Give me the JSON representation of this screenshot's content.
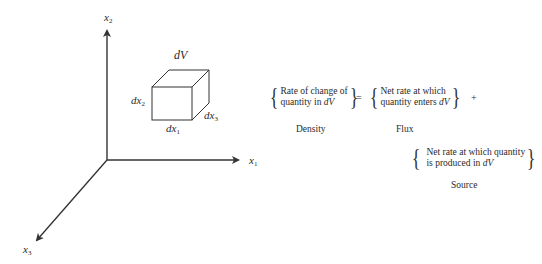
{
  "axes": {
    "x1": {
      "label": "x",
      "sub": "1"
    },
    "x2": {
      "label": "x",
      "sub": "2"
    },
    "x3": {
      "label": "x",
      "sub": "3"
    }
  },
  "cube": {
    "volume_label": "dV",
    "edges": [
      {
        "label": "dx",
        "sub": "1"
      },
      {
        "label": "dx",
        "sub": "2"
      },
      {
        "label": "dx",
        "sub": "3"
      }
    ]
  },
  "equation": {
    "density": {
      "line1": "Rate of change of",
      "line2_prefix": "quantity in ",
      "line2_var": "dV",
      "caption": "Density"
    },
    "equals": "=",
    "flux": {
      "line1": "Net rate at which",
      "line2_prefix": "quantity enters ",
      "line2_var": "dV",
      "caption": "Flux"
    },
    "plus": "+",
    "source": {
      "line1": "Net rate at which quantity",
      "line2_prefix": "is produced in ",
      "line2_var": "dV",
      "caption": "Source"
    },
    "brace_open": "{",
    "brace_close": "}"
  },
  "colors": {
    "line": "#333333",
    "background": "#ffffff"
  }
}
